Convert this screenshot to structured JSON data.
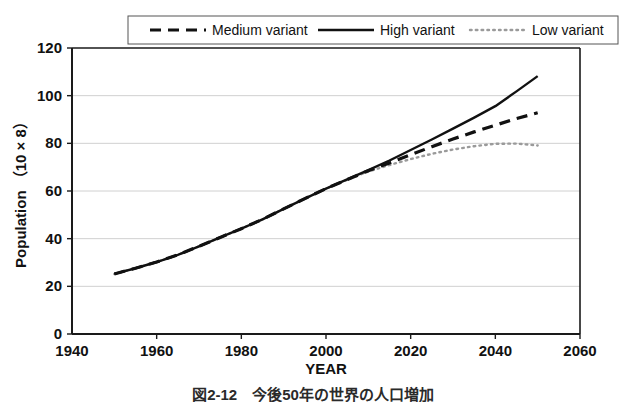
{
  "figure": {
    "caption_partial": "図2-12　今後50年の世界の人口増加"
  },
  "chart_data": {
    "type": "line",
    "title": "",
    "xlabel": "YEAR",
    "ylabel": "Population （10 × 8）",
    "xlim": [
      1940,
      2060
    ],
    "ylim": [
      0,
      120
    ],
    "xticks": [
      1940,
      1960,
      1980,
      2000,
      2020,
      2040,
      2060
    ],
    "yticks": [
      0,
      20,
      40,
      60,
      80,
      100,
      120
    ],
    "grid": "horizontal",
    "legend_position": "top",
    "x": [
      1950,
      1955,
      1960,
      1965,
      1970,
      1975,
      1980,
      1985,
      1990,
      1995,
      2000,
      2005,
      2010,
      2015,
      2020,
      2025,
      2030,
      2035,
      2040,
      2045,
      2050
    ],
    "series": [
      {
        "name": "Medium variant",
        "style": "dashed",
        "color": "#111111",
        "values": [
          25.2,
          27.6,
          30.2,
          33.2,
          36.8,
          40.5,
          44.2,
          48.1,
          52.5,
          56.8,
          61.0,
          64.8,
          68.5,
          71.8,
          75.2,
          78.6,
          81.8,
          84.8,
          87.6,
          90.4,
          92.8
        ]
      },
      {
        "name": "High variant",
        "style": "solid",
        "color": "#111111",
        "values": [
          25.2,
          27.6,
          30.2,
          33.2,
          36.8,
          40.5,
          44.2,
          48.1,
          52.5,
          56.8,
          61.0,
          64.9,
          68.8,
          72.8,
          77.2,
          81.6,
          86.2,
          90.8,
          95.6,
          101.8,
          108.2
        ]
      },
      {
        "name": "Low variant",
        "style": "dotted",
        "color": "#9a9a9a",
        "values": [
          25.2,
          27.6,
          30.2,
          33.2,
          36.8,
          40.5,
          44.2,
          48.1,
          52.5,
          56.8,
          61.0,
          64.7,
          68.2,
          70.9,
          73.4,
          75.6,
          77.4,
          78.8,
          79.8,
          79.9,
          79.1
        ]
      }
    ],
    "legend": [
      {
        "label": "Medium variant",
        "style": "dashed"
      },
      {
        "label": "High variant",
        "style": "solid"
      },
      {
        "label": "Low variant",
        "style": "dotted"
      }
    ]
  }
}
